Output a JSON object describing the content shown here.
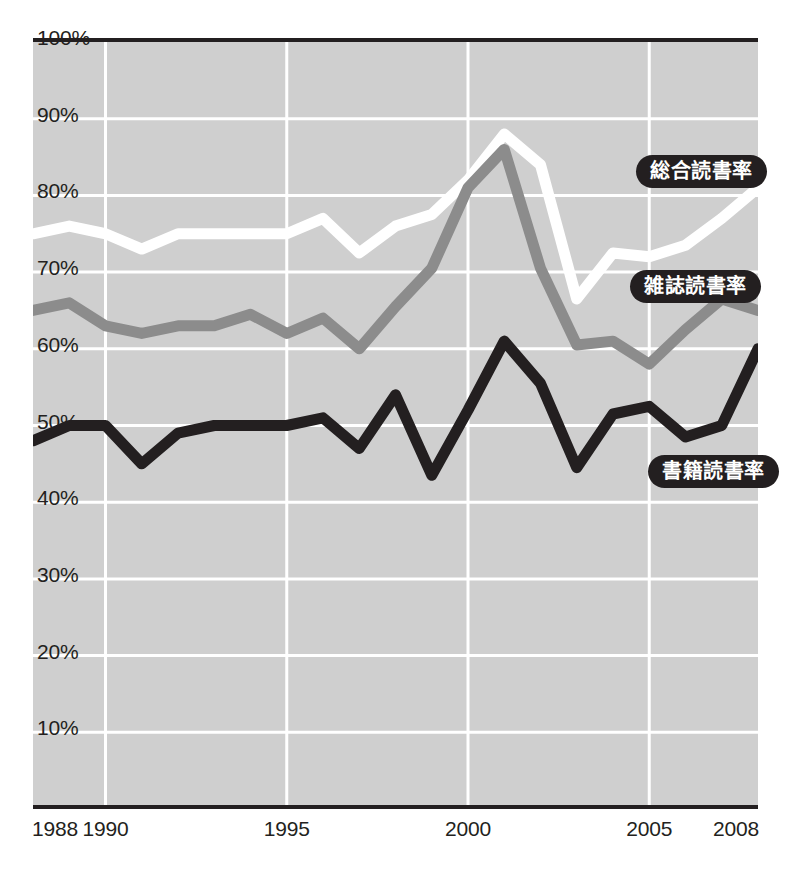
{
  "chart_data": {
    "type": "line",
    "title": "",
    "subtitle": "",
    "xlabel": "",
    "ylabel": "",
    "xlim": [
      1988,
      2008
    ],
    "ylim": [
      0,
      100
    ],
    "grid": true,
    "legend_position": "inline-callout",
    "background_color": "#cfcfcf",
    "axis_color": "#231f20",
    "gridline_color": "#ffffff",
    "y_ticks": [
      "10%",
      "20%",
      "30%",
      "40%",
      "50%",
      "60%",
      "70%",
      "80%",
      "90%",
      "100%"
    ],
    "y_tick_values": [
      10,
      20,
      30,
      40,
      50,
      60,
      70,
      80,
      90,
      100
    ],
    "x_ticks": [
      "1988",
      "1990",
      "1995",
      "2000",
      "2005",
      "2008"
    ],
    "x_tick_values": [
      1988,
      1990,
      1995,
      2000,
      2005,
      2008
    ],
    "x": [
      1988,
      1989,
      1990,
      1991,
      1992,
      1993,
      1994,
      1995,
      1996,
      1997,
      1998,
      1999,
      2000,
      2001,
      2002,
      2003,
      2004,
      2005,
      2006,
      2007,
      2008
    ],
    "series": [
      {
        "name": "総合読書率",
        "color": "#ffffff",
        "label": "総合読書率",
        "values": [
          75.0,
          76.0,
          75.0,
          73.0,
          75.0,
          75.0,
          75.0,
          75.0,
          77.0,
          72.5,
          76.0,
          77.5,
          82.0,
          88.0,
          84.0,
          66.5,
          72.5,
          72.0,
          73.5,
          77.0,
          81.0
        ]
      },
      {
        "name": "雑誌読書率",
        "color": "#8c8c8c",
        "label": "雑誌読書率",
        "values": [
          65.0,
          66.0,
          63.0,
          62.0,
          63.0,
          63.0,
          64.5,
          62.0,
          64.0,
          60.0,
          65.5,
          70.5,
          81.0,
          86.0,
          70.5,
          60.5,
          61.0,
          58.0,
          62.5,
          66.5,
          65.0
        ]
      },
      {
        "name": "書籍読書率",
        "color": "#231f20",
        "label": "書籍読書率",
        "values": [
          48.0,
          50.0,
          50.0,
          45.0,
          49.0,
          50.0,
          50.0,
          50.0,
          51.0,
          47.0,
          54.0,
          43.5,
          52.0,
          61.0,
          55.5,
          44.5,
          51.5,
          52.5,
          48.5,
          50.0,
          60.0
        ]
      }
    ],
    "callouts": [
      {
        "label": "総合読書率",
        "left": 636,
        "top": 155
      },
      {
        "label": "雑誌読書率",
        "left": 630,
        "top": 270
      },
      {
        "label": "書籍読書率",
        "left": 648,
        "top": 455
      }
    ]
  }
}
